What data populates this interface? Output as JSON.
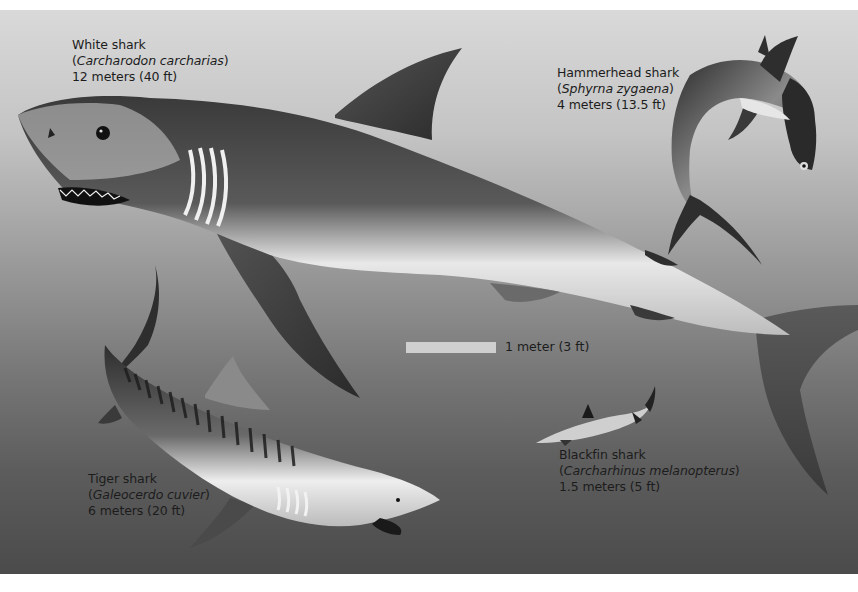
{
  "figure": {
    "background": {
      "top_color": "#d9d9d9",
      "bottom_color": "#4b4b4b"
    },
    "text_color": "#1c1c1c"
  },
  "sharks": [
    {
      "id": "white",
      "common_name": "White shark",
      "scientific_name": "Carcharodon carcharias",
      "size": "12 meters (40 ft)"
    },
    {
      "id": "hammerhead",
      "common_name": "Hammerhead shark",
      "scientific_name": "Sphyrna zygaena",
      "size": "4 meters (13.5 ft)"
    },
    {
      "id": "tiger",
      "common_name": "Tiger shark",
      "scientific_name": "Galeocerdo cuvier",
      "size": "6 meters (20 ft)"
    },
    {
      "id": "blackfin",
      "common_name": "Blackfin shark",
      "scientific_name": "Carcharhinus melanopterus",
      "size": "1.5 meters (5 ft)"
    }
  ],
  "scale": {
    "label": "1 meter (3 ft)",
    "bar_color": "#cfcfcf"
  }
}
